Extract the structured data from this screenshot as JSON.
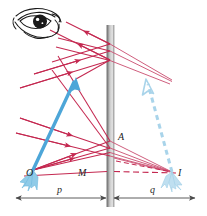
{
  "figure": {
    "background_color": "#ffffff",
    "width": 207,
    "height": 216
  },
  "colors": {
    "ray_red": "#c42850",
    "ray_red_light": "#d4607f",
    "object_blue": "#4da6d8",
    "image_blue": "#a9d4ea",
    "mirror_gray_dark": "#8d8d8d",
    "mirror_gray_light": "#d8d8d8",
    "dimension_line": "#555555",
    "eye_ink": "#1a1a1a",
    "label_ink": "#1a1a1a"
  },
  "labels": {
    "object_point": "O",
    "image_point": "I",
    "mirror_point_upper": "A",
    "mirror_point_axis": "M",
    "object_distance": "p",
    "image_distance": "q"
  },
  "elements": {
    "eye": "eye-icon",
    "mirror": "plane-mirror",
    "object_arrow": "object-arrow",
    "image_arrow": "image-arrow-dashed",
    "incident_rays": "incident-rays",
    "reflected_rays": "reflected-rays",
    "virtual_rays": "virtual-ray-extensions",
    "axis_line": "optical-axis",
    "dimension_axis": "distance-dimension-line"
  },
  "geometry": {
    "object_point_xy": [
      33,
      170
    ],
    "image_point_xy": [
      172,
      172
    ],
    "mirror_x": 110,
    "mirror_top_y": 25,
    "mirror_bottom_y": 207,
    "point_A_xy": [
      112,
      144
    ],
    "point_M_xy": [
      110,
      171
    ],
    "object_tip_xy": [
      76,
      79
    ],
    "image_tip_xy": [
      146,
      80
    ],
    "dimension_y": 198,
    "dimension_left_x": 14,
    "dimension_right_x": 196
  }
}
